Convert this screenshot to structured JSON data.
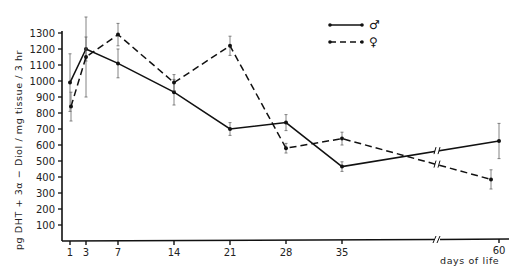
{
  "chart_data": {
    "type": "line",
    "title": "",
    "xlabel": "days of life",
    "ylabel": "pg DHT + 3α − Diol / mg tissue / 3 hr",
    "x": [
      1,
      3,
      7,
      14,
      21,
      28,
      35,
      60
    ],
    "x_tick_labels": [
      "1",
      "3",
      "7",
      "14",
      "21",
      "28",
      "35",
      "60"
    ],
    "y_ticks": [
      100,
      200,
      300,
      400,
      500,
      600,
      700,
      800,
      900,
      1000,
      1100,
      1200,
      1300
    ],
    "ylim": [
      0,
      1300
    ],
    "x_axis_break": "between 35 and 60",
    "grid": false,
    "legend_position": "top-right",
    "series": [
      {
        "name": "♂ (male)",
        "symbol": "♂",
        "line_style": "solid",
        "values": [
          990,
          1200,
          1110,
          930,
          700,
          740,
          465,
          625
        ],
        "error": [
          180,
          75,
          90,
          80,
          40,
          50,
          30,
          110
        ]
      },
      {
        "name": "♀ (female)",
        "symbol": "♀",
        "line_style": "dashed",
        "values": [
          840,
          1150,
          1290,
          990,
          1220,
          580,
          640,
          385
        ],
        "error": [
          90,
          250,
          70,
          50,
          60,
          30,
          40,
          60
        ]
      }
    ]
  }
}
